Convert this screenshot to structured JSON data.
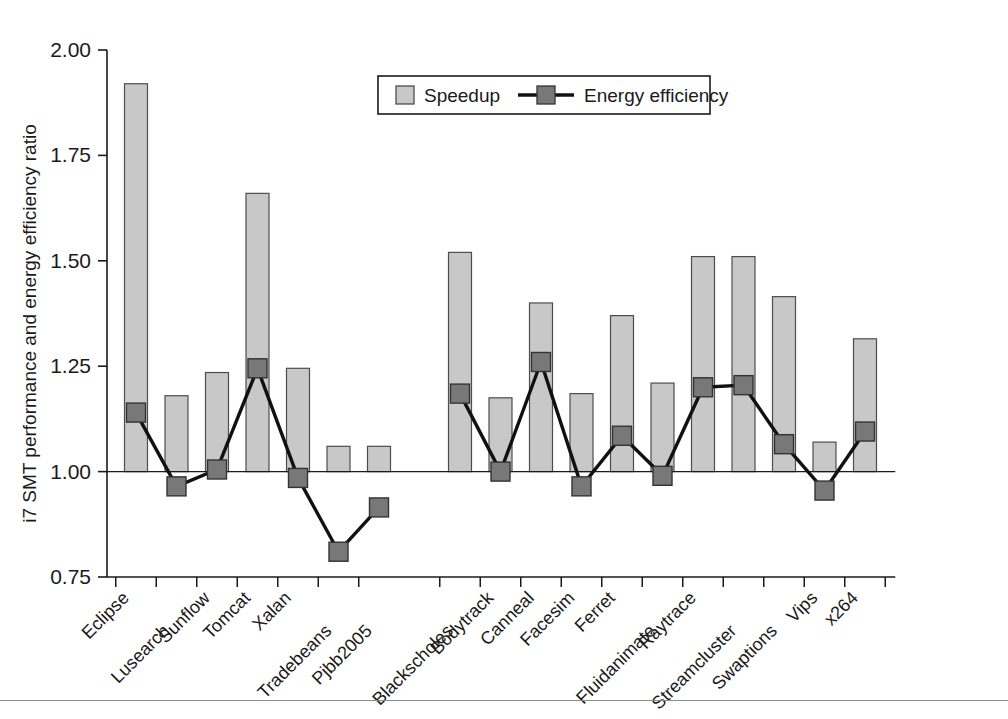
{
  "figure": {
    "background": "#ffffff",
    "axis_color": "#1a1a1a",
    "bar_fill": "#c8c8c8",
    "bar_stroke": "#4d4d4d",
    "marker_fill": "#787878",
    "marker_stroke": "#333333",
    "line_color": "#111111"
  },
  "legend": {
    "speedup_label": "Speedup",
    "energy_label": "Energy efficiency"
  },
  "chart_data": {
    "type": "bar",
    "title": "",
    "xlabel": "",
    "ylabel": "i7 SMT performance and energy efficiency ratio",
    "ylim": [
      0.75,
      2.0
    ],
    "yticks": [
      "0.75",
      "1.00",
      "1.25",
      "1.50",
      "1.75",
      "2.00"
    ],
    "ytick_values": [
      0.75,
      1.0,
      1.25,
      1.5,
      1.75,
      2.0
    ],
    "baseline": 1.0,
    "grid": false,
    "legend_position": "top-center",
    "groups": [
      {
        "name": "DaCapo/Java",
        "start_index": 0,
        "end_index": 6
      },
      {
        "name": "PARSEC",
        "start_index": 7,
        "end_index": 17
      }
    ],
    "categories": [
      "Eclipse",
      "Lusearch",
      "Sunflow",
      "Tomcat",
      "Xalan",
      "Tradebeans",
      "Pjbb2005",
      "Blackscholes",
      "Bodytrack",
      "Canneal",
      "Facesim",
      "Ferret",
      "Fluidanimate",
      "Raytrace",
      "Streamcluster",
      "Swaptions",
      "Vips",
      "x264"
    ],
    "series": [
      {
        "name": "Speedup",
        "type": "bar",
        "values": [
          1.92,
          1.18,
          1.235,
          1.66,
          1.245,
          1.06,
          1.06,
          1.52,
          1.175,
          1.4,
          1.185,
          1.37,
          1.21,
          1.51,
          1.51,
          1.415,
          1.07,
          1.315
        ]
      },
      {
        "name": "Energy efficiency",
        "type": "line",
        "values": [
          1.14,
          0.965,
          1.005,
          1.245,
          0.985,
          0.81,
          0.915,
          1.185,
          1.0,
          1.26,
          0.965,
          1.085,
          0.99,
          1.2,
          1.205,
          1.065,
          0.955,
          1.095
        ]
      }
    ]
  }
}
